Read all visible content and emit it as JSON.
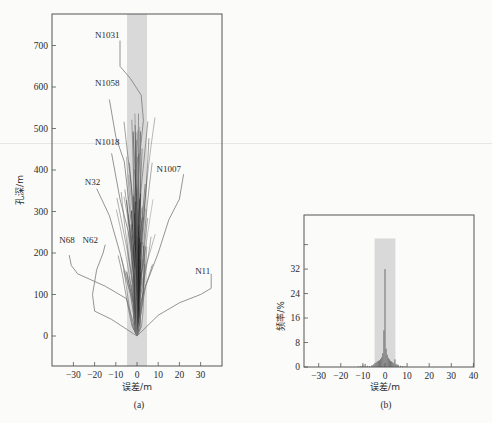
{
  "chart_data": [
    {
      "id": "a",
      "type": "line",
      "caption": "(a)",
      "title": "",
      "xlabel": "误差/m",
      "ylabel": "孔深/m",
      "xlim": [
        -38,
        40
      ],
      "ylim": [
        -70,
        760
      ],
      "xticks": [
        -30,
        -20,
        -10,
        0,
        10,
        20,
        30
      ],
      "yticks": [
        0,
        100,
        200,
        300,
        400,
        500,
        600,
        700
      ],
      "shaded_band": {
        "x_from": -4.7,
        "x_to": 4.7,
        "color": "#d9d9d9"
      },
      "grid": false,
      "legend": null,
      "labeled_series": [
        {
          "name": "N1031",
          "label_pos": [
            -14,
            718
          ],
          "points": [
            [
              0,
              0
            ],
            [
              0,
              300
            ],
            [
              1,
              420
            ],
            [
              3,
              520
            ],
            [
              2,
              580
            ],
            [
              -3,
              620
            ],
            [
              -8,
              650
            ],
            [
              -8,
              712
            ]
          ]
        },
        {
          "name": "N1058",
          "label_pos": [
            -14,
            602
          ],
          "points": [
            [
              0,
              0
            ],
            [
              -1,
              200
            ],
            [
              -4,
              330
            ],
            [
              -6,
              420
            ],
            [
              -10,
              480
            ],
            [
              -13,
              570
            ]
          ]
        },
        {
          "name": "N1018",
          "label_pos": [
            -14,
            460
          ],
          "points": [
            [
              0,
              0
            ],
            [
              -1,
              150
            ],
            [
              -4,
              250
            ],
            [
              -8,
              330
            ],
            [
              -12,
              440
            ]
          ]
        },
        {
          "name": "N1007",
          "label_pos": [
            15,
            395
          ],
          "points": [
            [
              0,
              0
            ],
            [
              4,
              120
            ],
            [
              10,
              200
            ],
            [
              15,
              280
            ],
            [
              20,
              330
            ],
            [
              22,
              390
            ]
          ]
        },
        {
          "name": "N32",
          "label_pos": [
            -21,
            365
          ],
          "points": [
            [
              0,
              0
            ],
            [
              -3,
              100
            ],
            [
              -8,
              200
            ],
            [
              -13,
              290
            ],
            [
              -19,
              355
            ]
          ]
        },
        {
          "name": "N68",
          "label_pos": [
            -33,
            225
          ],
          "points": [
            [
              0,
              0
            ],
            [
              -5,
              90
            ],
            [
              -15,
              120
            ],
            [
              -28,
              150
            ],
            [
              -31,
              170
            ],
            [
              -32,
              195
            ]
          ]
        },
        {
          "name": "N62",
          "label_pos": [
            -22,
            225
          ],
          "points": [
            [
              0,
              0
            ],
            [
              -12,
              40
            ],
            [
              -20,
              60
            ],
            [
              -21,
              100
            ],
            [
              -19,
              160
            ],
            [
              -16,
              200
            ],
            [
              -15,
              220
            ]
          ]
        },
        {
          "name": "N11",
          "label_pos": [
            31,
            150
          ],
          "points": [
            [
              0,
              0
            ],
            [
              10,
              50
            ],
            [
              20,
              80
            ],
            [
              30,
              100
            ],
            [
              35,
              115
            ],
            [
              35,
              150
            ]
          ]
        }
      ],
      "unlabeled_series_count": 80,
      "notes": "Dense bundle of borehole trajectories converging near 0 error; many within ±5 m band"
    },
    {
      "id": "b",
      "type": "bar",
      "caption": "(b)",
      "title": "",
      "xlabel": "误差/m",
      "ylabel": "频率/%",
      "xlim": [
        -35,
        40
      ],
      "ylim": [
        0,
        48
      ],
      "xticks": [
        -30,
        -20,
        -10,
        0,
        10,
        20,
        30,
        40
      ],
      "yticks": [
        0,
        8,
        16,
        24,
        32,
        40
      ],
      "ytick_labels": [
        "0",
        "8",
        "16",
        "24",
        "32",
        ""
      ],
      "shaded_band": {
        "x_from": -4.7,
        "x_to": 4.7,
        "y_to": 42,
        "color": "#d9d9d9"
      },
      "grid": false,
      "legend": null,
      "bin_width": 0.5,
      "categories": [
        -12,
        -11,
        -10,
        -9,
        -8,
        -7,
        -6,
        -5.5,
        -5,
        -4.5,
        -4,
        -3.5,
        -3,
        -2.5,
        -2,
        -1.5,
        -1,
        -0.5,
        0,
        0.5,
        1,
        1.5,
        2,
        2.5,
        3,
        3.5,
        4,
        4.5,
        5,
        5.5,
        6,
        7,
        8,
        9
      ],
      "values": [
        0.2,
        0.3,
        0.5,
        1.0,
        0.4,
        0.3,
        0.5,
        0.6,
        1.0,
        1.3,
        1.5,
        1.8,
        2.0,
        2.2,
        2.6,
        3.2,
        4.5,
        12,
        32,
        6,
        4,
        3,
        2.5,
        2.0,
        1.8,
        1.5,
        1.2,
        2.5,
        1.0,
        0.8,
        0.7,
        0.4,
        0.3,
        0.2
      ]
    }
  ],
  "figure": {
    "caption_a": "(a)",
    "caption_b": "(b)"
  }
}
